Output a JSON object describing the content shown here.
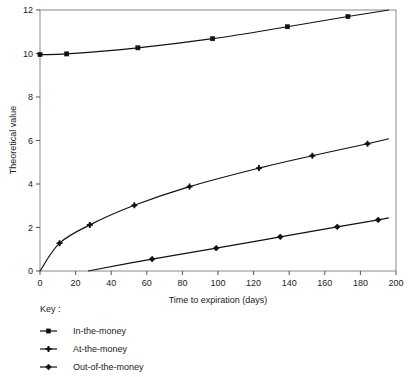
{
  "chart_data": {
    "type": "line",
    "title": "",
    "xlabel": "Time to expiration (days)",
    "ylabel": "Theoretical value",
    "xlim": [
      0,
      200
    ],
    "ylim": [
      0,
      12
    ],
    "xticks": [
      0,
      20,
      40,
      60,
      80,
      100,
      120,
      140,
      160,
      180,
      200
    ],
    "yticks": [
      0,
      2,
      4,
      6,
      8,
      10,
      12
    ],
    "grid": false,
    "legend_position": "below-left",
    "legend_title": "Key :",
    "line_color": "#111111",
    "series": [
      {
        "name": "In-the-money",
        "marker": "square",
        "points": [
          {
            "x": 0,
            "y": 9.95
          },
          {
            "x": 15,
            "y": 9.98
          },
          {
            "x": 55,
            "y": 10.26
          },
          {
            "x": 97,
            "y": 10.68
          },
          {
            "x": 139,
            "y": 11.23
          },
          {
            "x": 173,
            "y": 11.7
          },
          {
            "x": 196,
            "y": 12.0
          }
        ]
      },
      {
        "name": "At-the-money",
        "marker": "plus",
        "points": [
          {
            "x": 0,
            "y": 0.0
          },
          {
            "x": 11,
            "y": 1.28
          },
          {
            "x": 28,
            "y": 2.12
          },
          {
            "x": 53,
            "y": 3.02
          },
          {
            "x": 84,
            "y": 3.88
          },
          {
            "x": 123,
            "y": 4.73
          },
          {
            "x": 153,
            "y": 5.3
          },
          {
            "x": 184,
            "y": 5.85
          },
          {
            "x": 196,
            "y": 6.08
          }
        ]
      },
      {
        "name": "Out-of-the-money",
        "marker": "diamond",
        "points": [
          {
            "x": 27,
            "y": 0.0
          },
          {
            "x": 63,
            "y": 0.55
          },
          {
            "x": 99,
            "y": 1.05
          },
          {
            "x": 135,
            "y": 1.57
          },
          {
            "x": 167,
            "y": 2.03
          },
          {
            "x": 190,
            "y": 2.35
          },
          {
            "x": 196,
            "y": 2.44
          }
        ]
      }
    ]
  }
}
